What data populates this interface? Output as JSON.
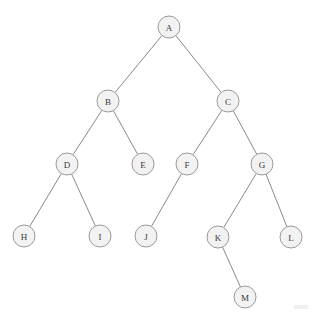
{
  "diagram": {
    "type": "tree",
    "background_color": "#ffffff",
    "node_fill_color": "#f2f2f2",
    "node_stroke_color": "#9a9a9a",
    "edge_color": "#8a8a8a",
    "label_color": "#3a3a3a",
    "node_radius": 11,
    "nodes": [
      {
        "id": "A",
        "label": "A",
        "x": 169,
        "y": 27,
        "depth": 0
      },
      {
        "id": "B",
        "label": "B",
        "x": 108,
        "y": 101,
        "depth": 1
      },
      {
        "id": "C",
        "label": "C",
        "x": 228,
        "y": 101,
        "depth": 1
      },
      {
        "id": "D",
        "label": "D",
        "x": 67,
        "y": 164,
        "depth": 2
      },
      {
        "id": "E",
        "label": "E",
        "x": 143,
        "y": 164,
        "depth": 2
      },
      {
        "id": "F",
        "label": "F",
        "x": 187,
        "y": 164,
        "depth": 2
      },
      {
        "id": "G",
        "label": "G",
        "x": 262,
        "y": 164,
        "depth": 2
      },
      {
        "id": "H",
        "label": "H",
        "x": 24,
        "y": 236,
        "depth": 3
      },
      {
        "id": "I",
        "label": "I",
        "x": 100,
        "y": 236,
        "depth": 3
      },
      {
        "id": "J",
        "label": "J",
        "x": 146,
        "y": 236,
        "depth": 3
      },
      {
        "id": "K",
        "label": "K",
        "x": 218,
        "y": 237,
        "depth": 3
      },
      {
        "id": "L",
        "label": "L",
        "x": 291,
        "y": 237,
        "depth": 3
      },
      {
        "id": "M",
        "label": "M",
        "x": 245,
        "y": 297,
        "depth": 4
      }
    ],
    "edges": [
      {
        "from": "A",
        "to": "B"
      },
      {
        "from": "A",
        "to": "C"
      },
      {
        "from": "B",
        "to": "D"
      },
      {
        "from": "B",
        "to": "E"
      },
      {
        "from": "C",
        "to": "F"
      },
      {
        "from": "C",
        "to": "G"
      },
      {
        "from": "D",
        "to": "H"
      },
      {
        "from": "D",
        "to": "I"
      },
      {
        "from": "F",
        "to": "J"
      },
      {
        "from": "G",
        "to": "K"
      },
      {
        "from": "G",
        "to": "L"
      },
      {
        "from": "K",
        "to": "M"
      }
    ]
  }
}
